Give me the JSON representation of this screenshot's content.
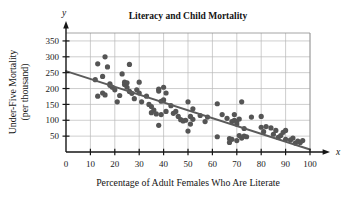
{
  "chart_data": {
    "type": "scatter",
    "title": "Literacy and Child Mortality",
    "xlabel": "Percentage of Adult Females Who Are Literate",
    "ylabel": "Under-Five Mortality (per thousand)",
    "ylabel_line1": "Under-Five Mortality",
    "ylabel_line2": "(per thousand)",
    "x_axis_name": "x",
    "y_axis_name": "y",
    "xlim": [
      0,
      100
    ],
    "ylim": [
      0,
      375
    ],
    "xticks": [
      0,
      10,
      20,
      30,
      40,
      50,
      60,
      70,
      80,
      90,
      100
    ],
    "yticks": [
      50,
      100,
      150,
      200,
      250,
      300,
      350
    ],
    "grid": true,
    "legend": "none",
    "point_color": "#555555",
    "trend_color": "#5b5b5b",
    "grid_color": "#b9b9b9",
    "axis_color": "#161616",
    "background": "#ffffff",
    "trend_line": {
      "label": "least-squares regression line",
      "x_start": 0,
      "y_start": 255,
      "x_end": 100,
      "y_end": 8
    },
    "points": [
      [
        12,
        228
      ],
      [
        13,
        176
      ],
      [
        13,
        278
      ],
      [
        15,
        186
      ],
      [
        15,
        238
      ],
      [
        16,
        300
      ],
      [
        16,
        180
      ],
      [
        17,
        268
      ],
      [
        18,
        215
      ],
      [
        18,
        210
      ],
      [
        19,
        204
      ],
      [
        20,
        196
      ],
      [
        21,
        158
      ],
      [
        22,
        178
      ],
      [
        23,
        246
      ],
      [
        24,
        220
      ],
      [
        24,
        213
      ],
      [
        25,
        218
      ],
      [
        25,
        204
      ],
      [
        26,
        276
      ],
      [
        26,
        191
      ],
      [
        27,
        185
      ],
      [
        28,
        168
      ],
      [
        29,
        196
      ],
      [
        30,
        220
      ],
      [
        30,
        186
      ],
      [
        31,
        158
      ],
      [
        33,
        176
      ],
      [
        34,
        150
      ],
      [
        35,
        143
      ],
      [
        35,
        124
      ],
      [
        36,
        132
      ],
      [
        37,
        120
      ],
      [
        38,
        198
      ],
      [
        38,
        192
      ],
      [
        38,
        84
      ],
      [
        39,
        160
      ],
      [
        39,
        118
      ],
      [
        40,
        204
      ],
      [
        40,
        164
      ],
      [
        41,
        186
      ],
      [
        41,
        128
      ],
      [
        43,
        146
      ],
      [
        44,
        122
      ],
      [
        45,
        128
      ],
      [
        46,
        112
      ],
      [
        47,
        102
      ],
      [
        48,
        98
      ],
      [
        49,
        100
      ],
      [
        50,
        158
      ],
      [
        50,
        66
      ],
      [
        51,
        112
      ],
      [
        51,
        88
      ],
      [
        52,
        136
      ],
      [
        52,
        103
      ],
      [
        55,
        115
      ],
      [
        57,
        96
      ],
      [
        58,
        110
      ],
      [
        62,
        152
      ],
      [
        62,
        48
      ],
      [
        64,
        118
      ],
      [
        66,
        106
      ],
      [
        67,
        30
      ],
      [
        67,
        42
      ],
      [
        68,
        96
      ],
      [
        68,
        40
      ],
      [
        69,
        118
      ],
      [
        69,
        100
      ],
      [
        70,
        88
      ],
      [
        70,
        36
      ],
      [
        70,
        96
      ],
      [
        71,
        104
      ],
      [
        71,
        52
      ],
      [
        72,
        158
      ],
      [
        72,
        44
      ],
      [
        73,
        74
      ],
      [
        73,
        50
      ],
      [
        74,
        48
      ],
      [
        76,
        110
      ],
      [
        80,
        112
      ],
      [
        80,
        78
      ],
      [
        81,
        64
      ],
      [
        82,
        80
      ],
      [
        84,
        76
      ],
      [
        85,
        56
      ],
      [
        86,
        68
      ],
      [
        87,
        46
      ],
      [
        88,
        52
      ],
      [
        89,
        62
      ],
      [
        90,
        40
      ],
      [
        90,
        68
      ],
      [
        92,
        38
      ],
      [
        93,
        44
      ],
      [
        94,
        28
      ],
      [
        95,
        34
      ],
      [
        96,
        30
      ],
      [
        97,
        36
      ]
    ]
  }
}
